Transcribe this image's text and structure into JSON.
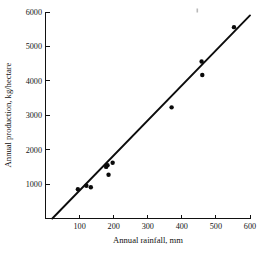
{
  "chart_data": {
    "type": "scatter",
    "title": "",
    "xlabel": "Annual rainfall, mm",
    "ylabel": "Annual production, kg/hectare",
    "xlim": [
      0,
      600
    ],
    "ylim": [
      0,
      6000
    ],
    "grid": false,
    "legend": "none",
    "xticks": [
      100,
      200,
      300,
      400,
      500,
      600
    ],
    "yticks": [
      1000,
      2000,
      3000,
      4000,
      5000,
      6000
    ],
    "xtick_labels": [
      "100",
      "200",
      "300",
      "400",
      "500",
      "600"
    ],
    "ytick_labels": [
      "1000",
      "2000",
      "3000",
      "4000",
      "5000",
      "6000"
    ],
    "series": [
      {
        "name": "observations",
        "marker": "filled-circle",
        "color": "#0a0a0a",
        "points": [
          {
            "x": 95,
            "y": 850
          },
          {
            "x": 120,
            "y": 950
          },
          {
            "x": 133,
            "y": 910
          },
          {
            "x": 178,
            "y": 1500
          },
          {
            "x": 182,
            "y": 1550
          },
          {
            "x": 185,
            "y": 1270
          },
          {
            "x": 197,
            "y": 1620
          },
          {
            "x": 370,
            "y": 3230
          },
          {
            "x": 458,
            "y": 4560
          },
          {
            "x": 460,
            "y": 4170
          },
          {
            "x": 553,
            "y": 5560
          }
        ]
      }
    ],
    "fit_line": {
      "name": "regression-line",
      "color": "#0d0d0d",
      "x_start": 20,
      "y_start": 0,
      "x_end": 600,
      "y_end": 5900
    },
    "annotations": [
      {
        "name": "page-speck",
        "x": 375,
        "y": 5960
      }
    ]
  }
}
